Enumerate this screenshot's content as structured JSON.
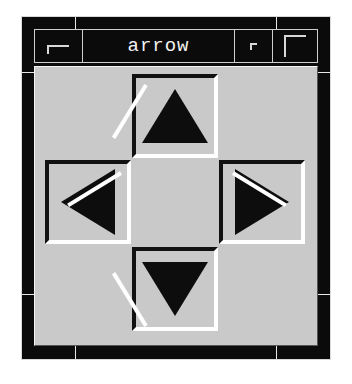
{
  "window": {
    "title": "arrow",
    "titlebar": {
      "menu_button": {
        "name": "window-menu-button",
        "glyph": "window-menu-icon"
      },
      "minimize_button": {
        "name": "minimize-button",
        "glyph": "minimize-icon"
      },
      "maximize_button": {
        "name": "maximize-button",
        "glyph": "maximize-icon"
      }
    },
    "colors": {
      "frame": "#0b0b0b",
      "titlebar_background": "#0b0b0b",
      "titlebar_text": "#f2f2f2",
      "client_background": "#c9c9c9",
      "bevel_shadow": "#111111",
      "bevel_highlight": "#ffffff",
      "arrow_fill": "#0d0d0d",
      "page_background": "#ffffff"
    }
  },
  "client": {
    "arrows": [
      {
        "id": "up",
        "label": "Up",
        "icon": "arrow-up-icon",
        "direction": "up"
      },
      {
        "id": "left",
        "label": "Left",
        "icon": "arrow-left-icon",
        "direction": "left"
      },
      {
        "id": "right",
        "label": "Right",
        "icon": "arrow-right-icon",
        "direction": "right"
      },
      {
        "id": "down",
        "label": "Down",
        "icon": "arrow-down-icon",
        "direction": "down"
      }
    ]
  }
}
